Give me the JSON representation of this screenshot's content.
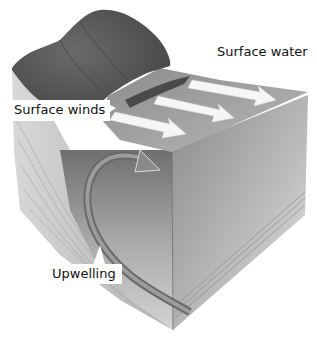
{
  "diagram": {
    "labels": {
      "surface_water": "Surface water",
      "surface_winds": "Surface winds",
      "upwelling": "Upwelling"
    },
    "colors": {
      "land": "#5e5e5e",
      "water_surface": "#a9a9a9",
      "water_column": "#bdbdbd",
      "arrow": "#f4f4f4",
      "background": "#ffffff"
    }
  }
}
